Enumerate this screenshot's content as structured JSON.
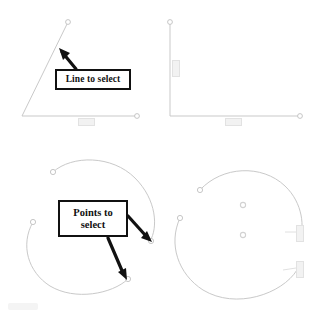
{
  "canvas": {
    "width": 323,
    "height": 320,
    "background": "#ffffff",
    "description": "CAD drawing instruction figure with four geometry panels and two annotation callouts"
  },
  "colors": {
    "geometry_line": "#c9c9c9",
    "geometry_line_dark": "#b4b4b4",
    "callout_border": "#111111",
    "callout_text": "#111111",
    "callout_fill": "#ffffff",
    "arrow": "#111111",
    "dimension_text": "#dadada",
    "dimension_fill": "#f2f2f2"
  },
  "callouts": [
    {
      "id": "line-to-select",
      "label": "Line to select",
      "lines": [
        "Line to select"
      ],
      "x": 55,
      "y": 69,
      "width": 76,
      "height": 21,
      "arrows": 1
    },
    {
      "id": "points-to-select",
      "label": "Points to select",
      "lines": [
        "Points to",
        "select"
      ],
      "x": 58,
      "y": 200,
      "width": 70,
      "height": 37,
      "arrows": 2
    }
  ],
  "panels": [
    {
      "id": "top-left",
      "name": "angled-line-panel",
      "geometry": "two-line-open-polyline",
      "vertices": [
        {
          "x": 68,
          "y": 22,
          "marker": "open-circle"
        },
        {
          "x": 22,
          "y": 116,
          "marker": "none"
        },
        {
          "x": 137,
          "y": 116,
          "marker": "open-circle"
        }
      ],
      "dimensions": [
        {
          "type": "horizontal",
          "x": 78,
          "y": 118,
          "value": ""
        }
      ]
    },
    {
      "id": "top-right",
      "name": "right-angle-panel",
      "geometry": "right-angle-polyline",
      "vertices": [
        {
          "x": 170,
          "y": 22,
          "marker": "open-circle"
        },
        {
          "x": 170,
          "y": 116,
          "marker": "none"
        },
        {
          "x": 300,
          "y": 116,
          "marker": "open-circle"
        }
      ],
      "dimensions": [
        {
          "type": "vertical",
          "x": 172,
          "y": 60,
          "value": ""
        },
        {
          "type": "horizontal",
          "x": 232,
          "y": 118,
          "value": ""
        }
      ]
    },
    {
      "id": "bottom-left",
      "name": "arc-points-panel",
      "geometry": "two-open-arcs",
      "arc_endpoints": [
        {
          "x": 53,
          "y": 172,
          "marker": "open-circle"
        },
        {
          "x": 33,
          "y": 222,
          "marker": "open-circle"
        },
        {
          "x": 152,
          "y": 240,
          "marker": "arrow-target"
        },
        {
          "x": 128,
          "y": 280,
          "marker": "arrow-target"
        }
      ],
      "dimensions": []
    },
    {
      "id": "bottom-right",
      "name": "arc-radius-panel",
      "geometry": "two-open-arcs-with-centers",
      "arc_endpoints": [
        {
          "x": 200,
          "y": 190,
          "marker": "open-circle"
        },
        {
          "x": 180,
          "y": 218,
          "marker": "open-circle"
        }
      ],
      "center_points": [
        {
          "x": 243,
          "y": 205,
          "marker": "open-circle"
        },
        {
          "x": 243,
          "y": 235,
          "marker": "open-circle"
        }
      ],
      "dimensions": [
        {
          "type": "vertical",
          "x": 299,
          "y": 232,
          "value": ""
        },
        {
          "type": "vertical",
          "x": 299,
          "y": 268,
          "value": ""
        }
      ]
    }
  ]
}
